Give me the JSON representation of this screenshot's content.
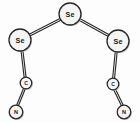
{
  "figure": {
    "style": "ball-and-stick skeletal formula",
    "background_color": "#fdfdfd",
    "line_color": "#2b2b2b",
    "atom_fill_color": "#f4f4f4",
    "atom_outline_color": "#272727"
  },
  "atoms": [
    {
      "id": "se-center",
      "label": "Se",
      "element": "Se",
      "name": "central-selenium-atom",
      "cx": 70,
      "cy": 14,
      "r": 11,
      "label_class": "label-se"
    },
    {
      "id": "se-left",
      "label": "Se",
      "element": "Se",
      "name": "left-selenium-atom",
      "cx": 20,
      "cy": 40,
      "r": 11,
      "label_class": "label-se"
    },
    {
      "id": "se-right",
      "label": "Se",
      "element": "Se",
      "name": "right-selenium-atom",
      "cx": 118,
      "cy": 41,
      "r": 11,
      "label_class": "label-se"
    },
    {
      "id": "c-left",
      "label": "C",
      "element": "C",
      "name": "left-carbon-atom",
      "cx": 26,
      "cy": 83,
      "r": 5.8,
      "label_class": "label-c"
    },
    {
      "id": "c-right",
      "label": "C",
      "element": "C",
      "name": "right-carbon-atom",
      "cx": 113,
      "cy": 84,
      "r": 5.8,
      "label_class": "label-c"
    },
    {
      "id": "n-left",
      "label": "N",
      "element": "N",
      "name": "left-nitrogen-atom",
      "cx": 16,
      "cy": 112,
      "r": 6.8,
      "label_class": "label-n"
    },
    {
      "id": "n-right",
      "label": "N",
      "element": "N",
      "name": "right-nitrogen-atom",
      "cx": 124,
      "cy": 112,
      "r": 6.8,
      "label_class": "label-n"
    }
  ],
  "bonds": [
    {
      "id": "bond-se-center-se-left",
      "name": "bond-central-se-to-left-se",
      "from": "se-center",
      "to": "se-left",
      "order": 2,
      "x1": 60.4,
      "y1": 19.3,
      "x2": 29.6,
      "y2": 35.2,
      "offset": 1.9
    },
    {
      "id": "bond-se-center-se-right",
      "name": "bond-central-se-to-right-se",
      "from": "se-center",
      "to": "se-right",
      "order": 2,
      "x1": 79.8,
      "y1": 19.6,
      "x2": 108.3,
      "y2": 35.4,
      "offset": 1.9
    },
    {
      "id": "bond-se-left-c-left",
      "name": "bond-left-se-to-left-carbon",
      "from": "se-left",
      "to": "c-left",
      "order": 2,
      "x1": 22.0,
      "y1": 50.9,
      "x2": 25.1,
      "y2": 77.3,
      "offset": 1.9
    },
    {
      "id": "bond-se-right-c-right",
      "name": "bond-right-se-to-right-carbon",
      "from": "se-right",
      "to": "c-right",
      "order": 2,
      "x1": 116.2,
      "y1": 51.9,
      "x2": 113.6,
      "y2": 78.3,
      "offset": 1.9
    },
    {
      "id": "bond-c-left-n-left",
      "name": "bond-left-carbon-to-left-nitrogen",
      "from": "c-left",
      "to": "n-left",
      "order": 2,
      "x1": 24.4,
      "y1": 88.6,
      "x2": 17.6,
      "y2": 105.4,
      "offset": 1.8
    },
    {
      "id": "bond-c-right-n-right",
      "name": "bond-right-carbon-to-right-nitrogen",
      "from": "c-right",
      "to": "n-right",
      "order": 2,
      "x1": 114.6,
      "y1": 89.5,
      "x2": 122.4,
      "y2": 105.5,
      "offset": 1.8
    }
  ]
}
